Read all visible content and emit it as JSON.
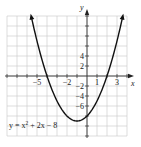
{
  "chart_data": {
    "type": "line",
    "title": "",
    "function": "y = x^2 + 2x - 8",
    "equation_label": {
      "prefix": "y = x",
      "exp": "2",
      "suffix": " + 2x − 8"
    },
    "xlabel": "x",
    "ylabel": "y",
    "xlim": [
      -8,
      4
    ],
    "ylim": [
      -12,
      12
    ],
    "x_grid_step": 1,
    "y_grid_step": 2,
    "grid": true,
    "x_tick_labels": [
      {
        "value": -5,
        "label": "−5"
      },
      {
        "value": -2,
        "label": "−2"
      },
      {
        "value": 1,
        "label": "1"
      },
      {
        "value": 3,
        "label": "3"
      }
    ],
    "y_tick_labels": [
      {
        "value": 4,
        "label": "4"
      },
      {
        "value": 2,
        "label": "2"
      },
      {
        "value": -2,
        "label": "−2"
      },
      {
        "value": -4,
        "label": "−4"
      },
      {
        "value": -6,
        "label": "−6"
      }
    ],
    "key_points": {
      "vertex": [
        -1,
        -9
      ],
      "y_intercept": [
        0,
        -8
      ],
      "x_intercepts": [
        [
          -4,
          0
        ],
        [
          2,
          0
        ]
      ]
    },
    "series": [
      {
        "name": "y = x^2 + 2x - 8",
        "x": [
          -5.58,
          -5,
          -4,
          -3,
          -2,
          -1,
          0,
          1,
          2,
          3,
          3.58
        ],
        "y": [
          12,
          7,
          0,
          -5,
          -8,
          -9,
          -8,
          -5,
          0,
          7,
          12
        ]
      }
    ],
    "colors": {
      "curve": "#111111",
      "grid": "#c8c8c8",
      "axis": "#333333"
    }
  }
}
